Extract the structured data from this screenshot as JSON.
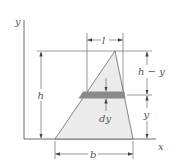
{
  "figure": {
    "axes": {
      "x_label": "x",
      "y_label": "y"
    },
    "dimensions": {
      "top_width": "l",
      "height": "h",
      "upper_segment": "h − y",
      "lower_segment": "y",
      "strip": "dy",
      "base_width": "b"
    },
    "colors": {
      "region_fill": "#ececec",
      "strip_fill": "#8a8a8a",
      "line": "#444444"
    }
  }
}
